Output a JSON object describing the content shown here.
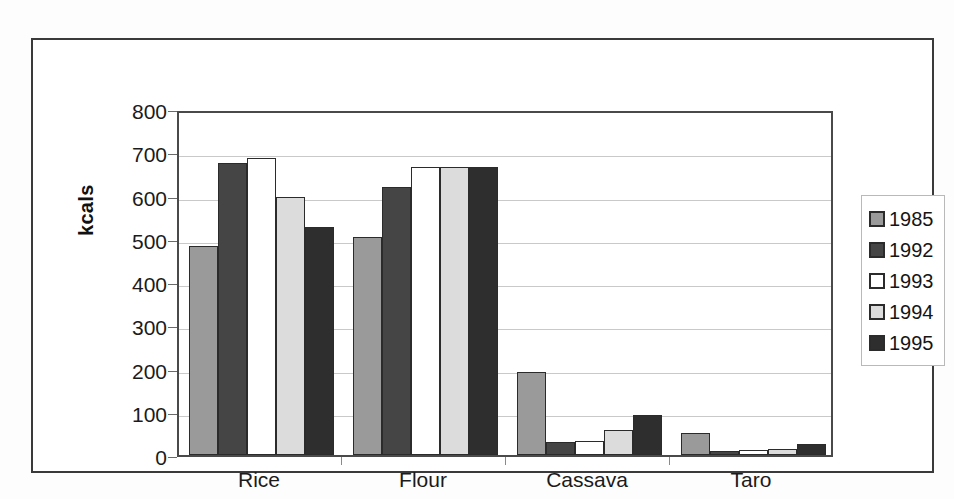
{
  "chart_data": {
    "type": "bar",
    "title": "",
    "xlabel": "",
    "ylabel": "kcals",
    "ylim": [
      0,
      800
    ],
    "ytick_step": 100,
    "yticks": [
      800,
      700,
      600,
      500,
      400,
      300,
      200,
      100,
      0
    ],
    "grid": true,
    "legend_position": "right",
    "categories": [
      "Rice",
      "Flour",
      "Cassava",
      "Taro"
    ],
    "series": [
      {
        "name": "1985",
        "color": "#9a9a9a",
        "values": [
          483,
          505,
          192,
          52
        ]
      },
      {
        "name": "1992",
        "color": "#454545",
        "values": [
          676,
          620,
          30,
          10
        ]
      },
      {
        "name": "1993",
        "color": "#ffffff",
        "values": [
          686,
          665,
          33,
          11
        ]
      },
      {
        "name": "1994",
        "color": "#dcdcdc",
        "values": [
          596,
          665,
          58,
          14
        ]
      },
      {
        "name": "1995",
        "color": "#2e2e2e",
        "values": [
          528,
          666,
          93,
          26
        ]
      }
    ]
  },
  "legend": {
    "items": [
      {
        "label": "1985",
        "color": "#9a9a9a"
      },
      {
        "label": "1992",
        "color": "#454545"
      },
      {
        "label": "1993",
        "color": "#ffffff"
      },
      {
        "label": "1994",
        "color": "#dcdcdc"
      },
      {
        "label": "1995",
        "color": "#2e2e2e"
      }
    ]
  },
  "colors": {
    "axis": "#4a4a4a",
    "grid": "#c9c9c9",
    "bar_outline": "#2b2b2b",
    "frame": "#3a3a3a",
    "text": "#1b1b1b",
    "background": "#ffffff"
  }
}
